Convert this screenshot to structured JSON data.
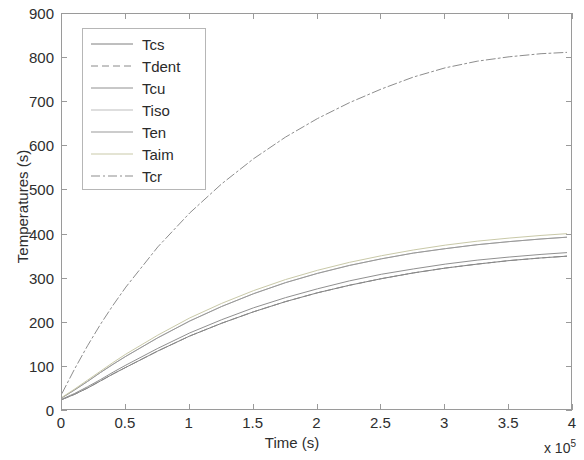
{
  "chart_data": {
    "type": "line",
    "title": "",
    "xlabel": "Time (s)",
    "ylabel": "Temperatures (s)",
    "x_exponent_label": "x 10",
    "x_exponent_power": "5",
    "xlim": [
      0,
      4
    ],
    "ylim": [
      0,
      900
    ],
    "xticks": [
      "0",
      "0.5",
      "1",
      "1.5",
      "2",
      "2.5",
      "3",
      "3.5",
      "4"
    ],
    "xtick_values": [
      0,
      0.5,
      1,
      1.5,
      2,
      2.5,
      3,
      3.5,
      4
    ],
    "yticks": [
      "0",
      "100",
      "200",
      "300",
      "400",
      "500",
      "600",
      "700",
      "800",
      "900"
    ],
    "ytick_values": [
      0,
      100,
      200,
      300,
      400,
      500,
      600,
      700,
      800,
      900
    ],
    "grid": false,
    "legend_position": "upper-left-inside",
    "x": [
      0,
      0.1,
      0.2,
      0.3,
      0.4,
      0.5,
      0.75,
      1.0,
      1.25,
      1.5,
      1.75,
      2.0,
      2.25,
      2.5,
      2.75,
      3.0,
      3.25,
      3.5,
      3.75,
      3.95
    ],
    "series": [
      {
        "name": "Tcs",
        "color": "#7f7f7f",
        "dash": "solid",
        "values": [
          26,
          38,
          52,
          68,
          84,
          99,
          136,
          170,
          199,
          225,
          248,
          268,
          285,
          300,
          313,
          324,
          333,
          341,
          347,
          351
        ]
      },
      {
        "name": "Tdent",
        "color": "#8a8a8a",
        "dash": "dashed",
        "values": [
          26,
          38,
          52,
          68,
          84,
          99,
          136,
          170,
          199,
          225,
          248,
          268,
          285,
          300,
          313,
          324,
          333,
          341,
          347,
          351
        ]
      },
      {
        "name": "Tcu",
        "color": "#909090",
        "dash": "solid",
        "values": [
          27,
          40,
          55,
          71,
          88,
          104,
          142,
          177,
          207,
          234,
          257,
          277,
          295,
          310,
          322,
          333,
          342,
          349,
          355,
          359
        ]
      },
      {
        "name": "Tiso",
        "color": "#bdbdbd",
        "dash": "solid",
        "values": [
          30,
          48,
          67,
          87,
          106,
          124,
          166,
          204,
          237,
          266,
          291,
          312,
          330,
          345,
          358,
          368,
          377,
          384,
          390,
          394
        ]
      },
      {
        "name": "Ten",
        "color": "#999999",
        "dash": "solid",
        "values": [
          30,
          48,
          67,
          87,
          106,
          124,
          166,
          204,
          237,
          266,
          291,
          312,
          330,
          345,
          358,
          368,
          377,
          384,
          390,
          394
        ]
      },
      {
        "name": "Taim",
        "color": "#c9c9a8",
        "dash": "solid",
        "values": [
          31,
          50,
          70,
          90,
          110,
          129,
          172,
          211,
          244,
          273,
          298,
          319,
          337,
          352,
          365,
          376,
          385,
          392,
          398,
          402
        ]
      },
      {
        "name": "Tcr",
        "color": "#8d8d8d",
        "dash": "dashdot",
        "values": [
          40,
          96,
          148,
          196,
          240,
          281,
          372,
          449,
          515,
          572,
          621,
          663,
          699,
          730,
          757,
          778,
          793,
          803,
          810,
          813
        ]
      }
    ]
  }
}
